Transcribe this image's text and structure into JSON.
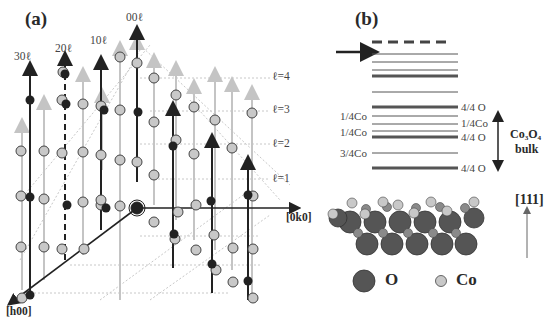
{
  "figure": {
    "panel_a": {
      "label": "(a)",
      "rod_labels": [
        "30ℓ",
        "20ℓ",
        "10ℓ",
        "00ℓ"
      ],
      "level_labels": [
        "ℓ=4",
        "ℓ=3",
        "ℓ=2",
        "ℓ=1"
      ],
      "axis_h": "[h00]",
      "axis_k": "[0k0]"
    },
    "panel_b": {
      "label": "(b)",
      "left_labels": [
        "1/4Co",
        "1/4Co",
        "3/4Co"
      ],
      "right_labels": [
        "4/4 O",
        "1/4Co",
        "4/4 O",
        "4/4 O"
      ],
      "bulk_label_line1": "Co₃O₄",
      "bulk_label_line2": "bulk",
      "direction_label": "[111]",
      "legend": [
        {
          "symbol": "large dark sphere",
          "label": "O",
          "color": "#555555"
        },
        {
          "symbol": "small light sphere",
          "label": "Co",
          "color": "#c8c8c8"
        }
      ]
    },
    "colors": {
      "oxygen": "#555555",
      "cobalt": "#c8c8c8",
      "rod_dark": "#222222",
      "rod_light": "#c0c0c0",
      "grid": "#c8c8c8"
    }
  }
}
